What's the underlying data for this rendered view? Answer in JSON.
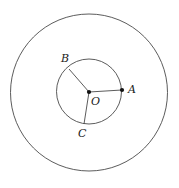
{
  "figure": {
    "background_color": "#ffffff",
    "stroke_color": "#4a4a4a",
    "label_color": "#1a1a1a",
    "dot_color": "#111111",
    "canvas": {
      "width": 179,
      "height": 188
    },
    "center": {
      "label": "O",
      "x": 89,
      "y": 92,
      "label_x": 91,
      "label_y": 96
    },
    "circles": [
      {
        "name": "outer-circle",
        "cx": 89,
        "cy": 92.5,
        "r": 78.5,
        "stroke_width": 0.9
      },
      {
        "name": "inner-circle",
        "cx": 89,
        "cy": 91.5,
        "r": 32.5,
        "stroke_width": 0.9
      }
    ],
    "points": [
      {
        "label": "A",
        "x": 122,
        "y": 90,
        "dot": true,
        "label_x": 128,
        "label_y": 84
      },
      {
        "label": "B",
        "x": 69,
        "y": 69,
        "dot": false,
        "label_x": 61,
        "label_y": 53
      },
      {
        "label": "C",
        "x": 84,
        "y": 124,
        "dot": false,
        "label_x": 78,
        "label_y": 128
      }
    ],
    "radii": [
      {
        "name": "radius-OA",
        "from": "O",
        "to": "A",
        "x1": 89,
        "y1": 92,
        "x2": 122,
        "y2": 90
      },
      {
        "name": "radius-OB",
        "from": "O",
        "to": "B",
        "x1": 89,
        "y1": 92,
        "x2": 69,
        "y2": 69
      },
      {
        "name": "radius-OC",
        "from": "O",
        "to": "C",
        "x1": 89,
        "y1": 92,
        "x2": 84,
        "y2": 124
      }
    ]
  }
}
